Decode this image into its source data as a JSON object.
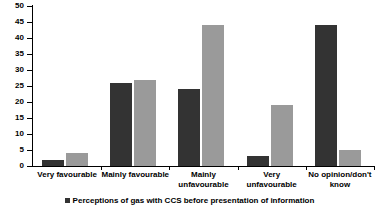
{
  "chart_data": {
    "type": "bar",
    "title": "",
    "xlabel": "",
    "ylabel": "",
    "ylim": [
      0,
      50
    ],
    "ytick_step": 5,
    "grid": false,
    "legend_position": "bottom",
    "categories": [
      "Very favourable",
      "Mainly favourable",
      "Mainly\nunfavourable",
      "Very unfavourable",
      "No opinion/don't\nknow"
    ],
    "yticks": [
      "0",
      "5",
      "10",
      "15",
      "20",
      "25",
      "30",
      "35",
      "40",
      "45",
      "50"
    ],
    "series": [
      {
        "name": "Perceptions of gas with CCS before presentation of information",
        "color": "#333333",
        "values": [
          2,
          26,
          24,
          3,
          44
        ]
      },
      {
        "name": "",
        "color": "#9a9a9a",
        "values": [
          4,
          27,
          44,
          19,
          5
        ]
      }
    ],
    "legend": [
      {
        "label": "Perceptions of gas with CCS before presentation of information",
        "color": "#333333"
      }
    ]
  }
}
